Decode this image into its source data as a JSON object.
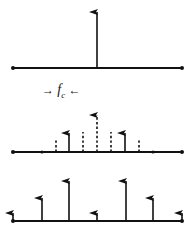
{
  "figure": {
    "title": "",
    "background_color": "#ffffff",
    "ink_color": "#111111",
    "width": 192,
    "height": 240,
    "annotation": {
      "left_arrow_glyph": "→",
      "symbol": "f",
      "subscript": "c",
      "right_arrow_glyph": "←",
      "full_text": "→ f_c ←",
      "x": 88,
      "y": 92
    }
  },
  "chart_data": [
    {
      "id": "panel-top",
      "type": "line",
      "name": "baseband-impulse-spectrum",
      "title": "",
      "xlabel": "",
      "ylabel": "",
      "axis": {
        "x_start": 13,
        "x_end": 182,
        "baseline_y": 68,
        "grid": false,
        "legend": null
      },
      "xlim": [
        13,
        182
      ],
      "ylim": [
        0,
        56
      ],
      "baseline_markers": [
        {
          "x": 13,
          "style": "endpoint-dot"
        },
        {
          "x": 182,
          "style": "endpoint-dot"
        }
      ],
      "impulses": [
        {
          "x": 97,
          "height": 56,
          "style": "solid",
          "head": "arrow",
          "label": ""
        }
      ]
    },
    {
      "id": "panel-middle",
      "type": "line",
      "name": "modulated-spectrum-with-envelope",
      "title": "",
      "xlabel": "",
      "ylabel": "",
      "axis": {
        "x_start": 13,
        "x_end": 182,
        "baseline_y": 152,
        "grid": false,
        "legend": null
      },
      "xlim": [
        13,
        182
      ],
      "ylim": [
        0,
        37
      ],
      "baseline_markers": [
        {
          "x": 13,
          "style": "endpoint-dot"
        },
        {
          "x": 42,
          "style": "tick-dot"
        },
        {
          "x": 153,
          "style": "tick-dot"
        },
        {
          "x": 182,
          "style": "endpoint-dot"
        }
      ],
      "impulses": [
        {
          "x": 56,
          "height": 12,
          "style": "dashed",
          "head": "none",
          "label": ""
        },
        {
          "x": 69,
          "height": 19,
          "style": "solid",
          "head": "arrow",
          "label": ""
        },
        {
          "x": 83,
          "height": 20,
          "style": "dashed",
          "head": "none",
          "label": ""
        },
        {
          "x": 97,
          "height": 37,
          "style": "dashed",
          "head": "arrow",
          "label": ""
        },
        {
          "x": 111,
          "height": 20,
          "style": "dashed",
          "head": "none",
          "label": ""
        },
        {
          "x": 125,
          "height": 19,
          "style": "solid",
          "head": "arrow",
          "label": ""
        },
        {
          "x": 139,
          "height": 12,
          "style": "dashed",
          "head": "none",
          "label": ""
        }
      ]
    },
    {
      "id": "panel-bottom",
      "type": "line",
      "name": "sampled-impulse-spectrum",
      "title": "",
      "xlabel": "",
      "ylabel": "",
      "axis": {
        "x_start": 13,
        "x_end": 182,
        "baseline_y": 221,
        "grid": false,
        "legend": null
      },
      "xlim": [
        13,
        182
      ],
      "ylim": [
        0,
        40
      ],
      "baseline_markers": [
        {
          "x": 13,
          "style": "endpoint-dot"
        },
        {
          "x": 182,
          "style": "endpoint-dot"
        }
      ],
      "impulses": [
        {
          "x": 13,
          "height": 8,
          "style": "solid",
          "head": "arrow",
          "label": ""
        },
        {
          "x": 42,
          "height": 23,
          "style": "solid",
          "head": "arrow",
          "label": ""
        },
        {
          "x": 69,
          "height": 40,
          "style": "solid",
          "head": "arrow",
          "label": ""
        },
        {
          "x": 97,
          "height": 8,
          "style": "solid",
          "head": "arrow",
          "label": ""
        },
        {
          "x": 126,
          "height": 40,
          "style": "solid",
          "head": "arrow",
          "label": ""
        },
        {
          "x": 153,
          "height": 23,
          "style": "solid",
          "head": "arrow",
          "label": ""
        },
        {
          "x": 182,
          "height": 8,
          "style": "solid",
          "head": "arrow",
          "label": ""
        }
      ]
    }
  ]
}
